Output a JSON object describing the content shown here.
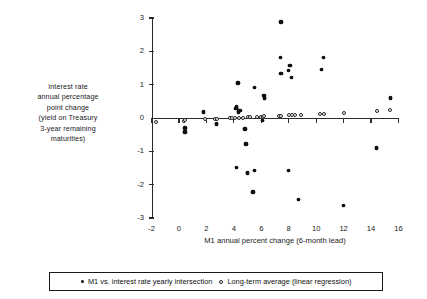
{
  "chart_data": {
    "type": "scatter",
    "title": "",
    "xlabel": "M1 annual percent change (6-month lead)",
    "ylabel": "Interest rate annual percentage point change (yield on Treasury 3-year remaining maturities)",
    "ylabel_lines": [
      "Interest rate",
      "annual percentage",
      "point change",
      "(yield on Treasury",
      "3-year remaining",
      "maturities)"
    ],
    "xlim": [
      -2,
      16
    ],
    "ylim": [
      -3,
      3
    ],
    "xticks": [
      -2,
      0,
      2,
      4,
      6,
      8,
      10,
      12,
      14,
      16
    ],
    "xticklabels": [
      "-2",
      "0",
      "2",
      "4",
      "6",
      "8",
      "10",
      "12",
      "14",
      "16"
    ],
    "yticks": [
      -3,
      -2,
      -1,
      0,
      1,
      2,
      3
    ],
    "yticklabels": [
      "-3",
      "-2",
      "-1",
      "0",
      "1",
      "2",
      "3"
    ],
    "grid": false,
    "legend_position": "bottom",
    "series": [
      {
        "name": "M1 vs. interest rate yearly intersection",
        "marker": "filled-circle",
        "color": "#111111",
        "points": [
          [
            0.45,
            -0.3
          ],
          [
            0.45,
            -0.42
          ],
          [
            1.8,
            0.18
          ],
          [
            2.75,
            -0.18
          ],
          [
            4.15,
            0.28
          ],
          [
            4.2,
            0.33
          ],
          [
            4.35,
            0.18
          ],
          [
            4.45,
            0.22
          ],
          [
            4.3,
            1.05
          ],
          [
            4.8,
            -0.33
          ],
          [
            4.9,
            -0.78
          ],
          [
            5.5,
            0.92
          ],
          [
            6.2,
            0.68
          ],
          [
            6.25,
            0.6
          ],
          [
            6.1,
            -0.08
          ],
          [
            7.45,
            2.88
          ],
          [
            7.4,
            1.82
          ],
          [
            7.45,
            1.33
          ],
          [
            8.1,
            1.58
          ],
          [
            8.0,
            1.42
          ],
          [
            8.2,
            1.22
          ],
          [
            10.55,
            1.82
          ],
          [
            10.4,
            1.45
          ],
          [
            15.4,
            0.6
          ],
          [
            4.2,
            -1.48
          ],
          [
            5.0,
            -1.65
          ],
          [
            5.5,
            -1.58
          ],
          [
            5.4,
            -2.22
          ],
          [
            8.0,
            -1.58
          ],
          [
            8.7,
            -2.45
          ],
          [
            12.0,
            -2.62
          ],
          [
            14.4,
            -0.9
          ]
        ]
      },
      {
        "name": "Long-term average (linear regression)",
        "marker": "open-circle",
        "color": "#222222",
        "points": [
          [
            -1.65,
            -0.12
          ],
          [
            0.4,
            -0.08
          ],
          [
            0.45,
            -0.06
          ],
          [
            1.9,
            -0.04
          ],
          [
            2.6,
            -0.03
          ],
          [
            2.8,
            -0.03
          ],
          [
            3.7,
            -0.01
          ],
          [
            3.85,
            -0.01
          ],
          [
            4.05,
            0.0
          ],
          [
            4.4,
            0.01
          ],
          [
            4.7,
            0.01
          ],
          [
            5.0,
            0.02
          ],
          [
            5.2,
            0.02
          ],
          [
            5.7,
            0.03
          ],
          [
            5.95,
            0.04
          ],
          [
            6.1,
            0.04
          ],
          [
            6.2,
            0.05
          ],
          [
            7.3,
            0.07
          ],
          [
            7.45,
            0.07
          ],
          [
            8.0,
            0.08
          ],
          [
            8.25,
            0.09
          ],
          [
            8.45,
            0.09
          ],
          [
            8.9,
            0.1
          ],
          [
            10.3,
            0.13
          ],
          [
            10.6,
            0.13
          ],
          [
            12.0,
            0.16
          ],
          [
            14.4,
            0.22
          ],
          [
            15.4,
            0.25
          ]
        ]
      }
    ]
  },
  "legend": {
    "entries": [
      {
        "label": "M1 vs. interest rate yearly intersection",
        "marker": "filled-circle"
      },
      {
        "label": "Long-term average (linear regression)",
        "marker": "open-circle"
      }
    ]
  }
}
